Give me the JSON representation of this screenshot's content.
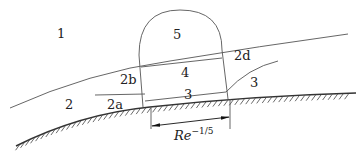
{
  "diagram": {
    "type": "triple-deck boundary layer structure",
    "regions": [
      {
        "id": "1",
        "label": "1"
      },
      {
        "id": "2",
        "label": "2"
      },
      {
        "id": "2a",
        "label": "2a"
      },
      {
        "id": "2b",
        "label": "2b"
      },
      {
        "id": "2c",
        "label": "2c"
      },
      {
        "id": "2d",
        "label": "2d"
      },
      {
        "id": "3",
        "label": "3"
      },
      {
        "id": "4",
        "label": "4"
      },
      {
        "id": "5",
        "label": "5"
      }
    ],
    "dimension": {
      "base": "Re",
      "exponent": "−1/5"
    }
  }
}
